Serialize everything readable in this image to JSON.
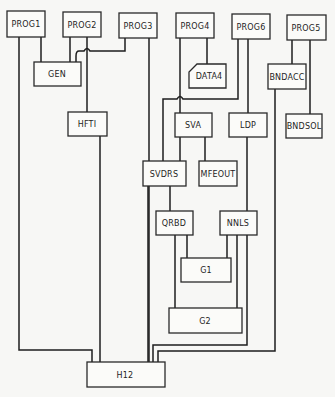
{
  "diagram": {
    "type": "call-graph",
    "nodes": {
      "prog1": {
        "label": "PROG1"
      },
      "prog2": {
        "label": "PROG2"
      },
      "prog3": {
        "label": "PROG3"
      },
      "prog4": {
        "label": "PROG4"
      },
      "prog6": {
        "label": "PROG6"
      },
      "prog5": {
        "label": "PROG5"
      },
      "gen": {
        "label": "GEN"
      },
      "data4": {
        "label": "DATA4"
      },
      "bndacc": {
        "label": "BNDACC"
      },
      "hfti": {
        "label": "HFTI"
      },
      "sva": {
        "label": "SVA"
      },
      "ldp": {
        "label": "LDP"
      },
      "bndsol": {
        "label": "BNDSOL"
      },
      "svdrs": {
        "label": "SVDRS"
      },
      "mfeout": {
        "label": "MFEOUT"
      },
      "qrbd": {
        "label": "QRBD"
      },
      "nnls": {
        "label": "NNLS"
      },
      "g1": {
        "label": "G1"
      },
      "g2": {
        "label": "G2"
      },
      "h12": {
        "label": "H12"
      }
    },
    "edges": [
      {
        "from": "PROG1",
        "to": "GEN"
      },
      {
        "from": "PROG1",
        "to": "H12"
      },
      {
        "from": "PROG2",
        "to": "GEN"
      },
      {
        "from": "PROG2",
        "to": "HFTI"
      },
      {
        "from": "PROG3",
        "to": "GEN"
      },
      {
        "from": "PROG3",
        "to": "H12"
      },
      {
        "from": "PROG4",
        "to": "DATA4"
      },
      {
        "from": "PROG4",
        "to": "SVA"
      },
      {
        "from": "PROG6",
        "to": "LDP"
      },
      {
        "from": "PROG6",
        "to": "SVDRS"
      },
      {
        "from": "PROG5",
        "to": "BNDACC"
      },
      {
        "from": "PROG5",
        "to": "BNDSOL"
      },
      {
        "from": "HFTI",
        "to": "H12"
      },
      {
        "from": "SVA",
        "to": "SVDRS"
      },
      {
        "from": "SVA",
        "to": "MFEOUT"
      },
      {
        "from": "LDP",
        "to": "NNLS"
      },
      {
        "from": "SVDRS",
        "to": "QRBD"
      },
      {
        "from": "SVDRS",
        "to": "H12"
      },
      {
        "from": "QRBD",
        "to": "G1"
      },
      {
        "from": "QRBD",
        "to": "G2"
      },
      {
        "from": "NNLS",
        "to": "G1"
      },
      {
        "from": "NNLS",
        "to": "G2"
      },
      {
        "from": "NNLS",
        "to": "H12"
      },
      {
        "from": "BNDACC",
        "to": "H12"
      }
    ]
  }
}
